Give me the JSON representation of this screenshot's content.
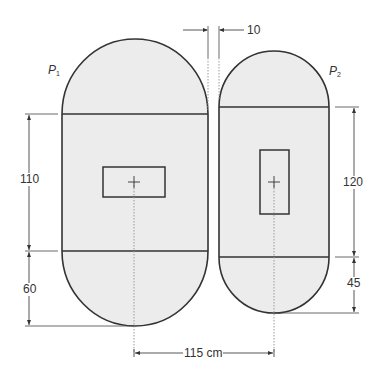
{
  "diagram": {
    "title": "",
    "shapes": [
      {
        "id": "P1",
        "label": "P",
        "subscript": "1",
        "band_height": 110,
        "cap_height": 60
      },
      {
        "id": "P2",
        "label": "P",
        "subscript": "2",
        "band_height": 120,
        "cap_height": 45
      }
    ],
    "dimensions": {
      "gap": "10",
      "p1_band": "110",
      "p1_cap": "60",
      "p2_band": "120",
      "p2_cap": "45",
      "center_distance": "115 cm"
    },
    "colors": {
      "fill": "#ececec",
      "stroke": "#333333",
      "background": "#ffffff"
    }
  }
}
